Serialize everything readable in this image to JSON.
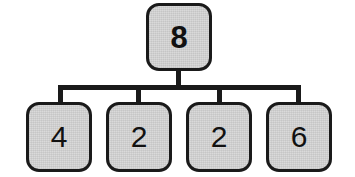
{
  "diagram": {
    "type": "tree",
    "canvas": {
      "width": 355,
      "height": 177,
      "background": "#ffffff"
    },
    "style": {
      "node_fill": "#d6d6d6",
      "node_border": "#1a1a1a",
      "connector_color": "#1a1a1a",
      "text_color": "#111111"
    },
    "root": {
      "label": "8",
      "shape": "rounded-rectangle",
      "emphasis": "bold"
    },
    "children": [
      {
        "label": "4",
        "shape": "rounded-rectangle",
        "emphasis": "normal"
      },
      {
        "label": "2",
        "shape": "rounded-rectangle",
        "emphasis": "normal"
      },
      {
        "label": "2",
        "shape": "rounded-rectangle",
        "emphasis": "normal"
      },
      {
        "label": "6",
        "shape": "rounded-rectangle",
        "emphasis": "normal"
      }
    ]
  }
}
